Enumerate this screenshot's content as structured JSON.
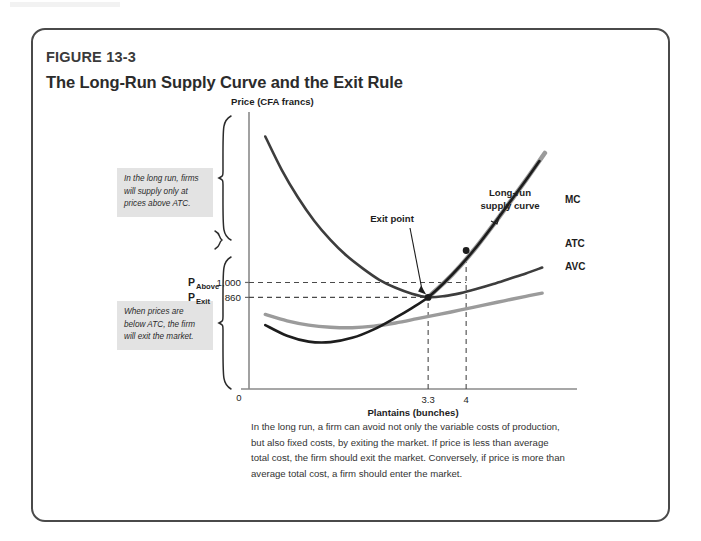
{
  "figure": {
    "number": "FIGURE 13-3",
    "title": "The Long-Run Supply Curve and the Exit Rule",
    "caption": "In the long run, a firm can avoid not only the variable costs of production, but also fixed costs, by exiting the market. If price is less than average total cost, the firm should exit the market. Conversely, if price is more than average total cost, a firm should enter the market.",
    "border_color": "#4a4a4a",
    "background_color": "#ffffff"
  },
  "callouts": {
    "above": "In the long run, firms will supply only at prices above ATC.",
    "below": "When prices are below ATC, the firm will exit the market.",
    "background_color": "#e3e3e3"
  },
  "annotations": {
    "exit_point": "Exit point",
    "long_run_supply_line1": "Long-run",
    "long_run_supply_line2": "supply curve"
  },
  "axis_labels": {
    "y_title": "Price (CFA francs)",
    "x_title": "Plantains (bunches)",
    "origin": "0"
  },
  "price_markers": [
    {
      "symbol": "P",
      "subscript": "Above",
      "value": "1,000"
    },
    {
      "symbol": "P",
      "subscript": "Exit",
      "value": "860"
    }
  ],
  "curve_labels": [
    {
      "name": "MC",
      "color": "#1d1d1d"
    },
    {
      "name": "ATC",
      "color": "#3d3d3d"
    },
    {
      "name": "AVC",
      "color": "#9b9b9b"
    }
  ],
  "chart_data": {
    "type": "line",
    "title": "The Long-Run Supply Curve and the Exit Rule",
    "xlabel": "Plantains (bunches)",
    "ylabel": "Price (CFA francs)",
    "xlim": [
      0,
      5.6
    ],
    "ylim": [
      0,
      2600
    ],
    "grid": false,
    "legend": "right-of-curve-ends",
    "xticks": [
      {
        "value": 3.3,
        "label": "3.3"
      },
      {
        "value": 4,
        "label": "4"
      }
    ],
    "yticks": [
      {
        "value": 1000,
        "label": "1,000"
      },
      {
        "value": 860,
        "label": "860"
      }
    ],
    "series": [
      {
        "name": "ATC",
        "color": "#3d3d3d",
        "width": 2.6,
        "points": [
          [
            0.3,
            2370
          ],
          [
            0.6,
            2060
          ],
          [
            0.9,
            1800
          ],
          [
            1.2,
            1580
          ],
          [
            1.5,
            1400
          ],
          [
            1.8,
            1250
          ],
          [
            2.1,
            1130
          ],
          [
            2.4,
            1025
          ],
          [
            2.7,
            950
          ],
          [
            3.0,
            895
          ],
          [
            3.3,
            862
          ],
          [
            3.6,
            872
          ],
          [
            3.9,
            900
          ],
          [
            4.2,
            940
          ],
          [
            4.5,
            985
          ],
          [
            4.8,
            1035
          ],
          [
            5.1,
            1085
          ],
          [
            5.4,
            1140
          ]
        ]
      },
      {
        "name": "AVC",
        "color": "#9b9b9b",
        "width": 3.4,
        "points": [
          [
            0.3,
            700
          ],
          [
            0.7,
            640
          ],
          [
            1.1,
            600
          ],
          [
            1.5,
            580
          ],
          [
            1.9,
            575
          ],
          [
            2.3,
            590
          ],
          [
            2.7,
            620
          ],
          [
            3.1,
            660
          ],
          [
            3.5,
            700
          ],
          [
            3.9,
            742
          ],
          [
            4.3,
            785
          ],
          [
            4.7,
            828
          ],
          [
            5.1,
            870
          ],
          [
            5.4,
            900
          ]
        ]
      },
      {
        "name": "MC",
        "color": "#1d1d1d",
        "width": 2.6,
        "points": [
          [
            0.3,
            600
          ],
          [
            0.7,
            500
          ],
          [
            1.1,
            445
          ],
          [
            1.5,
            440
          ],
          [
            1.9,
            480
          ],
          [
            2.3,
            560
          ],
          [
            2.7,
            670
          ],
          [
            3.0,
            760
          ],
          [
            3.3,
            862
          ],
          [
            3.6,
            1000
          ],
          [
            3.9,
            1160
          ],
          [
            4.2,
            1340
          ],
          [
            4.5,
            1540
          ],
          [
            4.8,
            1750
          ],
          [
            5.1,
            1960
          ],
          [
            5.35,
            2140
          ]
        ]
      },
      {
        "name": "Long-run supply curve",
        "color": "#9b9b9b",
        "width": 4.6,
        "points": [
          [
            3.3,
            862
          ],
          [
            3.6,
            1000
          ],
          [
            3.9,
            1160
          ],
          [
            4.2,
            1340
          ],
          [
            4.5,
            1540
          ],
          [
            4.8,
            1750
          ],
          [
            5.1,
            1960
          ],
          [
            5.45,
            2215
          ]
        ]
      }
    ],
    "markers": [
      {
        "x": 3.3,
        "y": 860,
        "label": "Exit point",
        "color": "#1d1d1d"
      },
      {
        "x": 4.0,
        "y": 1300,
        "label": "",
        "color": "#1d1d1d"
      }
    ],
    "reference_lines": [
      {
        "type": "horizontal",
        "value": 1000,
        "style": "dashed",
        "from_x": 0,
        "to_x": 4.0
      },
      {
        "type": "horizontal",
        "value": 860,
        "style": "dashed",
        "from_x": 0,
        "to_x": 3.3
      },
      {
        "type": "vertical",
        "value": 3.3,
        "style": "dashed",
        "from_y": 0,
        "to_y": 862
      },
      {
        "type": "vertical",
        "value": 4.0,
        "style": "dashed",
        "from_y": 0,
        "to_y": 1300
      }
    ]
  }
}
